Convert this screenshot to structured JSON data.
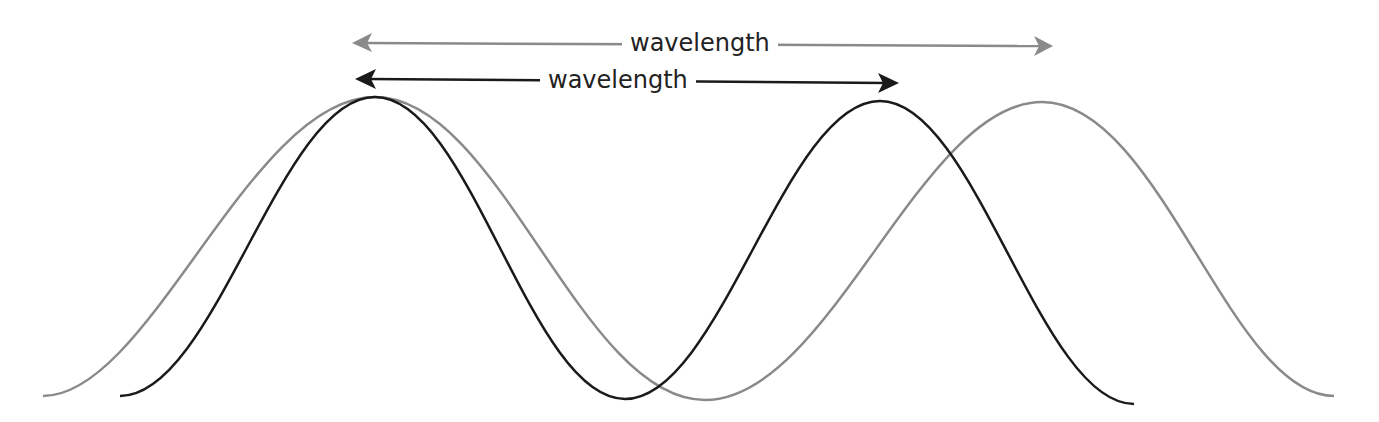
{
  "diagram": {
    "labels": {
      "gray_wavelength": "wavelength",
      "black_wavelength": "wavelength"
    },
    "colors": {
      "gray_wave": "#8a8a8a",
      "black_wave": "#1a1a1a",
      "background": "#ffffff"
    },
    "waves": [
      {
        "name": "gray",
        "start_x": 43,
        "peak1_x": 375,
        "trough_x": 705,
        "peak2_x": 1042,
        "end_x": 1334,
        "peak_y": 97,
        "trough_y": 400
      },
      {
        "name": "black",
        "start_x": 120,
        "peak1_x": 375,
        "trough_x": 625,
        "peak2_x": 880,
        "end_x": 1134,
        "peak_y": 97,
        "trough_y": 399
      }
    ],
    "arrows": [
      {
        "name": "gray-wavelength-arrow",
        "x1": 352,
        "x2": 1052,
        "y": 43
      },
      {
        "name": "black-wavelength-arrow",
        "x1": 355,
        "x2": 898,
        "y": 81
      }
    ]
  }
}
